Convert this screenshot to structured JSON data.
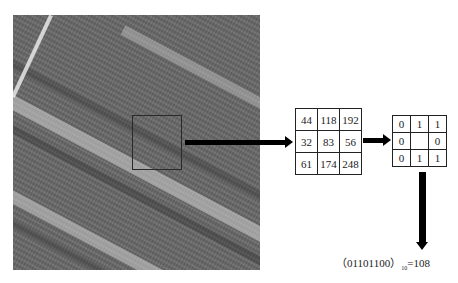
{
  "photo": {
    "description": "grayscale aerial photo of crop field rows",
    "selection_box": "3x3 neighborhood sample window"
  },
  "pixel_grid": {
    "rows": [
      [
        "44",
        "118",
        "192"
      ],
      [
        "32",
        "83",
        "56"
      ],
      [
        "61",
        "174",
        "248"
      ]
    ]
  },
  "binary_grid": {
    "rows": [
      [
        "0",
        "1",
        "1"
      ],
      [
        "0",
        "",
        "0"
      ],
      [
        "0",
        "1",
        "1"
      ]
    ]
  },
  "formula": {
    "open_paren": "（",
    "binary": "01101100",
    "close_paren": "）",
    "base": "10",
    "result": "=108"
  },
  "colors": {
    "arrow": "#000000",
    "grid_border": "#222222",
    "background": "#ffffff"
  }
}
